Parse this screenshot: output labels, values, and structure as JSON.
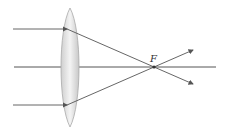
{
  "diagram": {
    "focal_label": "F",
    "colors": {
      "ray": "#555555",
      "lens_fill": "#d9d9d9",
      "lens_edge": "#999999",
      "axis": "#555555"
    }
  }
}
